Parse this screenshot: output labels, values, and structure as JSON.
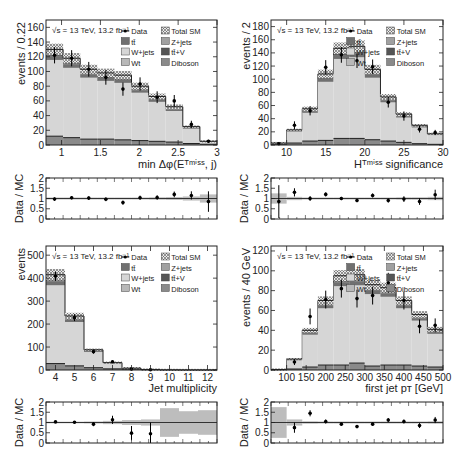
{
  "figure": {
    "energy_label": "√s = 13 TeV, 13.2 fb⁻¹",
    "legend": [
      {
        "key": "data",
        "label": "Data",
        "col": 0
      },
      {
        "key": "total",
        "label": "Total SM",
        "col": 1
      },
      {
        "key": "tt",
        "label": "tt̄",
        "col": 0
      },
      {
        "key": "zjets",
        "label": "Z+jets",
        "col": 1
      },
      {
        "key": "wjets",
        "label": "W+jets",
        "col": 0
      },
      {
        "key": "ttv",
        "label": "tt̄+V",
        "col": 1
      },
      {
        "key": "wt",
        "label": "Wt",
        "col": 0
      },
      {
        "key": "diboson",
        "label": "Diboson",
        "col": 1
      }
    ],
    "colors": {
      "wjets": "#d6d6d6",
      "tt": "#707070",
      "zjets": "#a0a0a0",
      "ttv": "#555555",
      "wt": "#b8b8b8",
      "diboson": "#8a8a8a",
      "band": "#bdbdbd",
      "frame": "#222222"
    },
    "ratio_ylabel": "Data / MC"
  },
  "chart_data": [
    {
      "id": "min-dphi",
      "type": "bar",
      "title": "",
      "xlabel": "min Δφ(E_T^miss, j)",
      "ylabel": "events / 0.22",
      "xlim": [
        0.8,
        3.0
      ],
      "ylim": [
        0,
        170
      ],
      "xticks": [
        1,
        1.5,
        2,
        2.5,
        3
      ],
      "yticks": [
        0,
        20,
        40,
        60,
        80,
        100,
        120,
        140,
        160
      ],
      "bin_edges": [
        0.8,
        1.02,
        1.24,
        1.46,
        1.68,
        1.9,
        2.12,
        2.34,
        2.56,
        2.78,
        3.0
      ],
      "mc_total": [
        130,
        118,
        103,
        98,
        95,
        80,
        66,
        52,
        25,
        5
      ],
      "mc_low": [
        12,
        10,
        8,
        8,
        7,
        6,
        5,
        4,
        2,
        1
      ],
      "data": [
        122,
        118,
        103,
        92,
        76,
        83,
        65,
        60,
        28,
        5
      ],
      "data_err": [
        11,
        11,
        10,
        10,
        9,
        9,
        8,
        8,
        5,
        2
      ],
      "ratio": [
        0.97,
        1.04,
        1.02,
        0.96,
        0.8,
        1.04,
        1.05,
        1.2,
        1.15,
        0.85
      ],
      "ratio_err": [
        0.08,
        0.08,
        0.09,
        0.09,
        0.1,
        0.1,
        0.11,
        0.14,
        0.2,
        0.5
      ],
      "ratio_band": [
        0.05,
        0.05,
        0.05,
        0.05,
        0.05,
        0.05,
        0.06,
        0.07,
        0.1,
        0.2
      ],
      "ratio_ylim": [
        0,
        2
      ],
      "ratio_yticks": [
        0,
        0.5,
        1,
        1.5,
        2
      ]
    },
    {
      "id": "htmiss-significance",
      "type": "bar",
      "title": "",
      "xlabel": "H_T^miss significance",
      "ylabel": "events / 2",
      "xlim": [
        8,
        30
      ],
      "ylim": [
        0,
        190
      ],
      "xticks": [
        10,
        15,
        20,
        25,
        30
      ],
      "yticks": [
        0,
        20,
        40,
        60,
        80,
        100,
        120,
        140,
        160,
        180
      ],
      "bin_edges": [
        8,
        10,
        12,
        14,
        16,
        18,
        20,
        22,
        24,
        26,
        28,
        30
      ],
      "mc_total": [
        3,
        23,
        55,
        108,
        147,
        150,
        115,
        73,
        47,
        30,
        17
      ],
      "mc_low": [
        1,
        3,
        6,
        7,
        10,
        10,
        8,
        6,
        4,
        2,
        1
      ],
      "data": [
        2,
        30,
        52,
        118,
        137,
        128,
        119,
        65,
        44,
        24,
        19
      ],
      "data_err": [
        1.5,
        6,
        7,
        11,
        12,
        11,
        11,
        8,
        7,
        5,
        4
      ],
      "ratio": [
        0.85,
        1.3,
        1.0,
        1.2,
        1.0,
        0.9,
        1.15,
        0.9,
        0.97,
        0.85,
        1.18
      ],
      "ratio_err": [
        0.8,
        0.2,
        0.12,
        0.1,
        0.08,
        0.08,
        0.1,
        0.1,
        0.14,
        0.16,
        0.25
      ],
      "ratio_band": [
        0.25,
        0.08,
        0.05,
        0.05,
        0.05,
        0.05,
        0.05,
        0.05,
        0.06,
        0.06,
        0.08
      ],
      "ratio_ylim": [
        0,
        2
      ],
      "ratio_yticks": [
        0,
        0.5,
        1,
        1.5,
        2
      ]
    },
    {
      "id": "jet-multiplicity",
      "type": "bar",
      "title": "",
      "xlabel": "Jet multiplicity",
      "ylabel": "events",
      "xlim": [
        3.5,
        12.5
      ],
      "ylim": [
        0,
        540
      ],
      "xticks": [
        4,
        5,
        6,
        7,
        8,
        9,
        10,
        11,
        12
      ],
      "yticks": [
        0,
        100,
        200,
        300,
        400,
        500
      ],
      "bin_edges": [
        3.5,
        4.5,
        5.5,
        6.5,
        7.5,
        8.5,
        9.5,
        10.5,
        11.5,
        12.5
      ],
      "mc_total": [
        415,
        235,
        88,
        32,
        8,
        2,
        0.5,
        0.2,
        0.1
      ],
      "mc_low": [
        28,
        18,
        10,
        5,
        2,
        1,
        0.3,
        0.1,
        0.05
      ],
      "data": [
        408,
        228,
        80,
        36,
        4,
        1,
        null,
        null,
        null
      ],
      "data_err": [
        20,
        15,
        9,
        6,
        2,
        1,
        null,
        null,
        null
      ],
      "ratio": [
        1.03,
        1.01,
        0.92,
        1.13,
        0.48,
        0.45,
        null,
        null,
        null
      ],
      "ratio_err": [
        0.05,
        0.06,
        0.1,
        0.2,
        0.35,
        0.55,
        null,
        null,
        null
      ],
      "ratio_band": [
        0.04,
        0.04,
        0.05,
        0.08,
        0.12,
        0.15,
        0.7,
        0.55,
        0.6
      ],
      "ratio_ylim": [
        0,
        2
      ],
      "ratio_yticks": [
        0,
        0.5,
        1,
        1.5,
        2
      ]
    },
    {
      "id": "first-jet-pt",
      "type": "bar",
      "title": "",
      "xlabel": "first jet p_T [GeV]",
      "ylabel": "events / 40 GeV",
      "xlim": [
        60,
        500
      ],
      "ylim": [
        0,
        125
      ],
      "xticks": [
        100,
        150,
        200,
        250,
        300,
        350,
        400,
        450,
        500
      ],
      "yticks": [
        0,
        20,
        40,
        60,
        80,
        100,
        120
      ],
      "bin_edges": [
        60,
        100,
        140,
        180,
        220,
        260,
        300,
        340,
        380,
        420,
        460,
        500
      ],
      "mc_total": [
        0.5,
        11,
        40,
        70,
        95,
        96,
        86,
        83,
        70,
        56,
        41
      ],
      "mc_low": [
        0.2,
        1,
        3,
        5,
        5,
        7,
        4,
        5,
        5,
        4,
        3
      ],
      "data": [
        null,
        8,
        54,
        71,
        82,
        72,
        75,
        88,
        70,
        44,
        45
      ],
      "data_err": [
        null,
        3,
        8,
        9,
        9,
        9,
        9,
        10,
        9,
        7,
        7
      ],
      "ratio": [
        null,
        0.75,
        1.45,
        1.05,
        0.92,
        0.8,
        0.92,
        1.12,
        1.05,
        0.85,
        1.12
      ],
      "ratio_err": [
        null,
        0.25,
        0.15,
        0.1,
        0.07,
        0.07,
        0.08,
        0.1,
        0.1,
        0.12,
        0.15
      ],
      "ratio_band": [
        0.75,
        0.15,
        0.06,
        0.05,
        0.05,
        0.05,
        0.05,
        0.05,
        0.05,
        0.05,
        0.06
      ],
      "ratio_ylim": [
        0,
        2
      ],
      "ratio_yticks": [
        0,
        0.5,
        1,
        1.5,
        2
      ]
    }
  ]
}
